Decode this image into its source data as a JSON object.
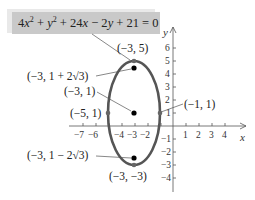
{
  "figure": {
    "equation": {
      "parts": [
        "4",
        "x",
        "2",
        " + ",
        "y",
        "2",
        " + 24",
        "x",
        " − 2",
        "y",
        " + 21 = 0"
      ],
      "plain": "4x^2 + y^2 + 24x - 2y + 21 = 0"
    },
    "axes": {
      "x_label": "x",
      "y_label": "y",
      "x_ticks": [
        "−7",
        "−6",
        "−4",
        "−3",
        "−2",
        "1",
        "2",
        "3",
        "4"
      ],
      "y_ticks": [
        "6",
        "5",
        "4",
        "3",
        "2",
        "1",
        "−1",
        "−2",
        "−3",
        "−4"
      ],
      "x_range": [
        -7.5,
        5
      ],
      "y_range": [
        -4.5,
        7
      ]
    },
    "ellipse": {
      "center": [
        -3,
        1
      ],
      "semi_axis_x": 2,
      "semi_axis_y": 4,
      "stroke_color": "#555555"
    },
    "labels": {
      "top_vertex": "(−3, 5)",
      "upper_focus": "(−3, 1 + 2√3)",
      "center": "(−3, 1)",
      "left_vertex": "(−5, 1)",
      "right_vertex": "(−1, 1)",
      "lower_focus": "(−3, 1 − 2√3)",
      "bottom_vertex": "(−3, −3)"
    },
    "points": [
      {
        "name": "top_vertex",
        "x": -3,
        "y": 5,
        "style": "vertex"
      },
      {
        "name": "upper_focus",
        "x": -3,
        "y": 4.464,
        "style": "focus"
      },
      {
        "name": "center",
        "x": -3,
        "y": 1,
        "style": "focus"
      },
      {
        "name": "left_vertex",
        "x": -5,
        "y": 1,
        "style": "vertex"
      },
      {
        "name": "right_vertex",
        "x": -1,
        "y": 1,
        "style": "vertex"
      },
      {
        "name": "lower_focus",
        "x": -3,
        "y": -2.464,
        "style": "focus"
      },
      {
        "name": "bottom_vertex",
        "x": -3,
        "y": -3,
        "style": "vertex"
      }
    ]
  }
}
